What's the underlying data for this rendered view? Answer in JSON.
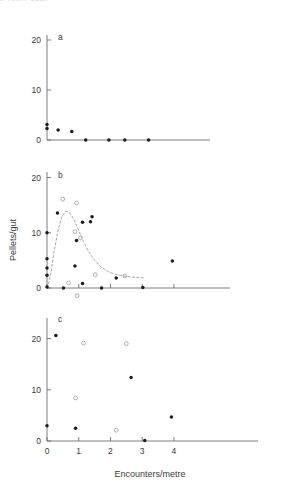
{
  "figure": {
    "cropped_header_text": "J. Anim. Ecol.",
    "x_axis_title": "Encounters/metre",
    "y_axis_title": "Pellets/gut",
    "series_styles": {
      "filled_label": "filled-circle",
      "open_label": "open-circle",
      "curve_label": "fitted-curve-dashed"
    },
    "colors": {
      "axis": "#6f6f6f",
      "filled_marker": "#1b1b1b",
      "open_marker": "#9a9a9a",
      "curve": "#9d9d9d",
      "text": "#3a3a3a",
      "background": "#ffffff"
    }
  },
  "chart_data": [
    {
      "type": "scatter",
      "panel": "a",
      "title": "a",
      "xlabel": "",
      "ylabel": "Pellets/gut",
      "xlim": [
        0,
        4.6
      ],
      "ylim": [
        0,
        21
      ],
      "xticks": [],
      "xticklabels": [],
      "yticks": [
        0,
        10,
        20
      ],
      "yticklabels": [
        "0",
        "10",
        "20"
      ],
      "grid": false,
      "legend": "none",
      "series": [
        {
          "name": "filled-circle",
          "marker": "filled",
          "points": [
            [
              0.0,
              3.1
            ],
            [
              0.0,
              2.3
            ],
            [
              0.35,
              2.0
            ],
            [
              0.78,
              1.7
            ],
            [
              1.22,
              0.0
            ],
            [
              1.95,
              0.0
            ],
            [
              2.45,
              0.0
            ],
            [
              3.2,
              0.0
            ]
          ]
        }
      ]
    },
    {
      "type": "scatter",
      "panel": "b",
      "title": "b",
      "xlabel": "",
      "ylabel": "Pellets/gut",
      "xlim": [
        0,
        4.6
      ],
      "ylim": [
        0,
        21
      ],
      "xticks": [
        0,
        1,
        2,
        3,
        4
      ],
      "xticklabels": [],
      "yticks": [
        0,
        10,
        20
      ],
      "yticklabels": [
        "0",
        "10",
        "20"
      ],
      "grid": false,
      "legend": "none",
      "series": [
        {
          "name": "filled-circle",
          "marker": "filled",
          "points": [
            [
              0.0,
              10.0
            ],
            [
              0.0,
              5.3
            ],
            [
              0.0,
              3.6
            ],
            [
              0.0,
              2.3
            ],
            [
              0.0,
              0.2
            ],
            [
              0.33,
              13.6
            ],
            [
              0.52,
              0.0
            ],
            [
              0.93,
              8.6
            ],
            [
              0.88,
              4.0
            ],
            [
              1.12,
              11.9
            ],
            [
              1.12,
              0.8
            ],
            [
              1.42,
              12.9
            ],
            [
              1.37,
              12.0
            ],
            [
              1.72,
              0.0
            ],
            [
              2.18,
              1.8
            ],
            [
              3.02,
              0.1
            ],
            [
              3.95,
              4.9
            ]
          ]
        },
        {
          "name": "open-circle",
          "marker": "open",
          "points": [
            [
              0.5,
              16.1
            ],
            [
              0.93,
              15.4
            ],
            [
              0.88,
              10.2
            ],
            [
              1.05,
              9.1
            ],
            [
              0.68,
              0.9
            ],
            [
              1.52,
              2.4
            ],
            [
              2.45,
              2.2
            ],
            [
              0.95,
              -1.4
            ]
          ]
        }
      ],
      "fitted_curve": {
        "name": "fitted-curve-dashed",
        "style": "dashed",
        "points": [
          [
            0.02,
            0.0
          ],
          [
            0.12,
            2.6
          ],
          [
            0.22,
            6.4
          ],
          [
            0.34,
            10.2
          ],
          [
            0.46,
            12.8
          ],
          [
            0.58,
            13.9
          ],
          [
            0.7,
            13.7
          ],
          [
            0.85,
            12.4
          ],
          [
            1.0,
            10.4
          ],
          [
            1.15,
            8.4
          ],
          [
            1.3,
            6.7
          ],
          [
            1.5,
            5.0
          ],
          [
            1.7,
            3.8
          ],
          [
            1.95,
            2.9
          ],
          [
            2.2,
            2.4
          ],
          [
            2.5,
            2.1
          ],
          [
            2.8,
            1.9
          ],
          [
            3.1,
            1.85
          ]
        ]
      }
    },
    {
      "type": "scatter",
      "panel": "c",
      "title": "c",
      "xlabel": "Encounters/metre",
      "ylabel": "",
      "xlim": [
        0,
        4.6
      ],
      "ylim": [
        0,
        24
      ],
      "xticks": [
        0,
        1,
        2,
        3,
        4
      ],
      "xticklabels": [
        "0",
        "1",
        "2",
        "3",
        "4"
      ],
      "yticks": [
        0,
        10,
        20
      ],
      "yticklabels": [
        "0",
        "10",
        "20"
      ],
      "grid": false,
      "legend": "none",
      "series": [
        {
          "name": "filled-circle",
          "marker": "filled",
          "points": [
            [
              0.0,
              3.0
            ],
            [
              0.28,
              20.6
            ],
            [
              0.9,
              2.5
            ],
            [
              2.65,
              12.4
            ],
            [
              3.08,
              0.1
            ],
            [
              3.92,
              4.7
            ]
          ]
        },
        {
          "name": "open-circle",
          "marker": "open",
          "points": [
            [
              1.15,
              19.1
            ],
            [
              2.5,
              19.0
            ],
            [
              0.9,
              8.4
            ],
            [
              2.18,
              2.1
            ]
          ]
        }
      ]
    }
  ]
}
